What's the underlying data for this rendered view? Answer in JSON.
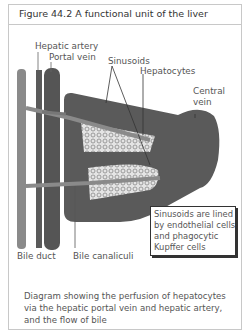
{
  "figure": {
    "title": "Figure 44.2   A functional unit of the liver",
    "labels": {
      "hepatic_artery": "Hepatic artery",
      "portal_vein": "Portal vein",
      "sinusoids": "Sinusoids",
      "hepatocytes": "Hepatocytes",
      "central_vein_line1": "Central",
      "central_vein_line2": "vein",
      "bile_duct": "Bile duct",
      "bile_canaliculi": "Bile canaliculi"
    },
    "callout": {
      "lines": [
        "Sinusoids are lined",
        "by endothelial cells",
        "and phagocytic",
        "Kupffer cells"
      ]
    },
    "caption": {
      "lines": [
        "Diagram showing the perfusion of hepatocytes",
        "via the hepatic portal vein and hepatic artery,",
        "and the flow of bile"
      ]
    },
    "colors": {
      "tissue": "#5a5a5a",
      "vessel_dark": "#555555",
      "bile_duct": "#8a8a8a",
      "hepatocyte_fill": "#d8d8d8"
    }
  }
}
